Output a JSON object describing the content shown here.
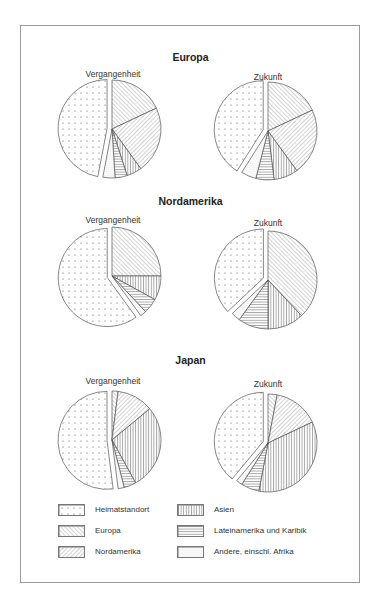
{
  "chart_data": {
    "type": "pie",
    "title": "",
    "legend": {
      "position": "bottom",
      "entries": [
        {
          "key": "heimat",
          "label": "Heimatstandort",
          "pattern": "dots"
        },
        {
          "key": "europa",
          "label": "Europa",
          "pattern": "hatch-back"
        },
        {
          "key": "nordamerika",
          "label": "Nordamerika",
          "pattern": "hatch-fwd"
        },
        {
          "key": "asien",
          "label": "Asien",
          "pattern": "vertical"
        },
        {
          "key": "lateinamerika",
          "label": "Lateinamerika und Karibik",
          "pattern": "horizontal"
        },
        {
          "key": "andere",
          "label": "Andere, einschl. Afrika",
          "pattern": "stipple"
        }
      ]
    },
    "regions": [
      {
        "name": "Europa",
        "charts": [
          {
            "label": "Vergangenheit",
            "exploded": "heimat",
            "slices": [
              {
                "key": "europa",
                "value": 18
              },
              {
                "key": "nordamerika",
                "value": 22
              },
              {
                "key": "asien",
                "value": 5
              },
              {
                "key": "lateinamerika",
                "value": 4
              },
              {
                "key": "andere",
                "value": 4
              },
              {
                "key": "heimat",
                "value": 47
              }
            ]
          },
          {
            "label": "Zukunft",
            "exploded": "heimat",
            "slices": [
              {
                "key": "europa",
                "value": 18
              },
              {
                "key": "nordamerika",
                "value": 22
              },
              {
                "key": "asien",
                "value": 8
              },
              {
                "key": "lateinamerika",
                "value": 6
              },
              {
                "key": "andere",
                "value": 5
              },
              {
                "key": "heimat",
                "value": 41
              }
            ]
          }
        ]
      },
      {
        "name": "Nordamerika",
        "charts": [
          {
            "label": "Vergangenheit",
            "exploded": "heimat",
            "slices": [
              {
                "key": "europa",
                "value": 25
              },
              {
                "key": "asien",
                "value": 8
              },
              {
                "key": "lateinamerika",
                "value": 5
              },
              {
                "key": "andere",
                "value": 2
              },
              {
                "key": "heimat",
                "value": 60
              }
            ]
          },
          {
            "label": "Zukunft",
            "exploded": "heimat",
            "slices": [
              {
                "key": "europa",
                "value": 38
              },
              {
                "key": "asien",
                "value": 12
              },
              {
                "key": "lateinamerika",
                "value": 10
              },
              {
                "key": "andere",
                "value": 3
              },
              {
                "key": "heimat",
                "value": 37
              }
            ]
          }
        ]
      },
      {
        "name": "Japan",
        "charts": [
          {
            "label": "Vergangenheit",
            "exploded": "heimat",
            "slices": [
              {
                "key": "europa",
                "value": 2
              },
              {
                "key": "nordamerika",
                "value": 12
              },
              {
                "key": "asien",
                "value": 28
              },
              {
                "key": "lateinamerika",
                "value": 4
              },
              {
                "key": "andere",
                "value": 2
              },
              {
                "key": "heimat",
                "value": 52
              }
            ]
          },
          {
            "label": "Zukunft",
            "exploded": "heimat",
            "slices": [
              {
                "key": "europa",
                "value": 3
              },
              {
                "key": "nordamerika",
                "value": 15
              },
              {
                "key": "asien",
                "value": 35
              },
              {
                "key": "lateinamerika",
                "value": 6
              },
              {
                "key": "andere",
                "value": 2
              },
              {
                "key": "heimat",
                "value": 39
              }
            ]
          }
        ]
      }
    ]
  },
  "titles": {
    "europa": "Europa",
    "nordamerika": "Nordamerika",
    "japan": "Japan"
  },
  "labels": {
    "past": "Vergangenheit",
    "future": "Zukunft"
  },
  "legend": {
    "heimat": "Heimatstandort",
    "europa": "Europa",
    "nordamerika": "Nordamerika",
    "asien": "Asien",
    "lateinamerika": "Lateinamerika und Karibik",
    "andere": "Andere, einschl. Afrika"
  },
  "colors": {
    "stroke": "#555555",
    "pattern": "#666666",
    "background": "#ffffff",
    "frame": "#9a9a9a"
  }
}
